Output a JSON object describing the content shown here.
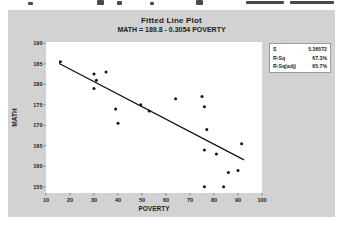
{
  "chart": {
    "title": "Fitted Line Plot",
    "subtitle": "MATH = 189.8 - 0.3054 POVERTY",
    "legend": [
      {
        "label": "S",
        "value": "5.36572"
      },
      {
        "label": "R-Sq",
        "value": "67.3%"
      },
      {
        "label": "R-Sq(adj)",
        "value": "65.7%"
      }
    ]
  },
  "chart_data": {
    "type": "scatter",
    "title": "Fitted Line Plot",
    "subtitle": "MATH = 189.8 - 0.3054 POVERTY",
    "xlabel": "POVERTY",
    "ylabel": "MATH",
    "xlim": [
      10,
      100
    ],
    "ylim": [
      155,
      190
    ],
    "x_ticks": [
      10,
      20,
      30,
      40,
      50,
      60,
      70,
      80,
      90,
      100
    ],
    "y_ticks": [
      155,
      160,
      165,
      170,
      175,
      180,
      185,
      190
    ],
    "grid": false,
    "points": [
      [
        16,
        185.5
      ],
      [
        30,
        182.5
      ],
      [
        35,
        183
      ],
      [
        31,
        181
      ],
      [
        30,
        179
      ],
      [
        39,
        174
      ],
      [
        40,
        170.5
      ],
      [
        49.5,
        175
      ],
      [
        53,
        173.5
      ],
      [
        64,
        176.5
      ],
      [
        75,
        177
      ],
      [
        76,
        174.5
      ],
      [
        77,
        169
      ],
      [
        76,
        164
      ],
      [
        81,
        163
      ],
      [
        91.5,
        165.5
      ],
      [
        86,
        158.5
      ],
      [
        90,
        159
      ],
      [
        76,
        155
      ],
      [
        84,
        155
      ]
    ],
    "fit_line": {
      "equation": "MATH = 189.8 - 0.3054 POVERTY",
      "intercept": 189.8,
      "slope": -0.3054,
      "x_start": 15.5,
      "x_end": 92.5
    },
    "stats": {
      "S": "5.36572",
      "R-Sq": "67.3%",
      "R-Sq(adj)": "65.7%"
    },
    "legend_position": "outside-top-right",
    "colors": {
      "panel_bg": "#d2d2d2",
      "plot_bg": "#ffffff",
      "point": "#111111",
      "line": "#111111",
      "text": "#1c1c1c"
    }
  }
}
